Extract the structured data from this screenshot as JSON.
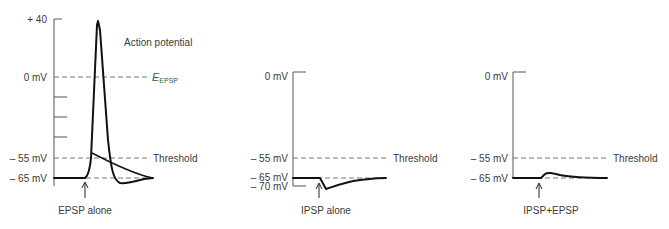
{
  "panels": [
    {
      "id": "epsp",
      "caption": "EPSP alone",
      "title": "Action potential",
      "reversal_label_main": "E",
      "reversal_label_sub": "EPSP",
      "reversal_color": "#2e6b2e",
      "threshold_label": "Threshold",
      "y_labels": [
        "+ 40",
        "0 mV",
        "– 55 mV",
        "– 65 mV"
      ]
    },
    {
      "id": "ipsp",
      "caption": "IPSP alone",
      "threshold_label": "Threshold",
      "y_labels": [
        "0 mV",
        "– 55 mV",
        "– 65 mV",
        "– 70 mV"
      ]
    },
    {
      "id": "ipsp-epsp",
      "caption": "IPSP+EPSP",
      "threshold_label": "Threshold",
      "y_labels": [
        "0 mV",
        "– 55 mV",
        "– 65 mV"
      ]
    }
  ]
}
